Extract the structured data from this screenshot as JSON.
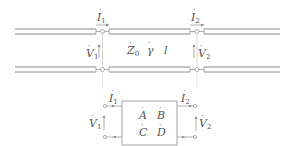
{
  "diagram": {
    "transmission_line": {
      "port1_current": "I",
      "port1_current_sub": "1",
      "port1_voltage": "V",
      "port1_voltage_sub": "1",
      "port2_current": "I",
      "port2_current_sub": "2",
      "port2_voltage": "V",
      "port2_voltage_sub": "2",
      "impedance": "Z",
      "impedance_sub": "0",
      "propagation": "γ",
      "length": "l"
    },
    "two_port": {
      "port1_current": "I",
      "port1_current_sub": "1",
      "port1_voltage": "V",
      "port1_voltage_sub": "1",
      "port2_current": "I",
      "port2_current_sub": "2",
      "port2_voltage": "V",
      "port2_voltage_sub": "2",
      "A": "A",
      "B": "B",
      "C": "C",
      "D": "D"
    },
    "colors": {
      "line": "#8a8a8a",
      "text": "#555555"
    }
  }
}
